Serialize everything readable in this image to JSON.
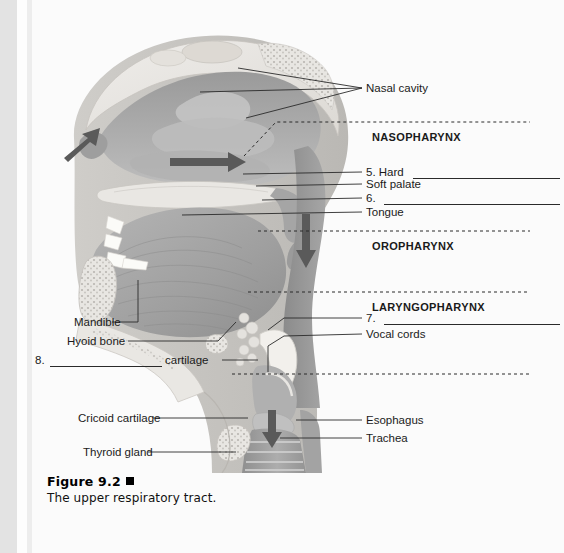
{
  "figure": {
    "number_label": "Figure 9.2",
    "marker": "square-bullet",
    "caption": "The upper respiratory tract."
  },
  "regions": [
    {
      "id": "nasopharynx",
      "label": "NASOPHARYNX"
    },
    {
      "id": "oropharynx",
      "label": "OROPHARYNX"
    },
    {
      "id": "laryngopharynx",
      "label": "LARYNGOPHARYNX"
    }
  ],
  "labels_right": [
    {
      "id": "nasal-cavity",
      "text": "Nasal cavity",
      "blank": false
    },
    {
      "id": "item-5",
      "text": "5. Hard",
      "blank": true
    },
    {
      "id": "soft-palate",
      "text": "Soft palate",
      "blank": false
    },
    {
      "id": "item-6",
      "text": "6.",
      "blank": true
    },
    {
      "id": "tongue",
      "text": "Tongue",
      "blank": false
    },
    {
      "id": "item-7",
      "text": "7.",
      "blank": true
    },
    {
      "id": "vocal-cords",
      "text": "Vocal cords",
      "blank": false
    },
    {
      "id": "esophagus",
      "text": "Esophagus",
      "blank": false
    },
    {
      "id": "trachea",
      "text": "Trachea",
      "blank": false
    }
  ],
  "labels_left": [
    {
      "id": "mandible",
      "text": "Mandible",
      "blank": false
    },
    {
      "id": "hyoid-bone",
      "text": "Hyoid bone",
      "blank": false
    },
    {
      "id": "item-8-number",
      "text": "8.",
      "blank": true
    },
    {
      "id": "item-8-suffix",
      "text": "cartilage",
      "blank": false
    },
    {
      "id": "cricoid-cartilage",
      "text": "Cricoid cartilage",
      "blank": false
    },
    {
      "id": "thyroid-gland",
      "text": "Thyroid gland",
      "blank": false
    }
  ],
  "airflow_arrows": [
    {
      "id": "inhaled-air-nostril",
      "direction": "up-left"
    },
    {
      "id": "nasal-airflow",
      "direction": "right"
    },
    {
      "id": "pharynx-airflow",
      "direction": "down"
    },
    {
      "id": "trachea-airflow",
      "direction": "down"
    }
  ],
  "colors": {
    "ink": "#1a1a1a",
    "leader": "#2a2a2a",
    "tissue_dark": "#8d8d8d",
    "tissue_mid": "#a9a9a9",
    "tissue_light": "#c9c9c9",
    "bone": "#e6e4e0",
    "page": "#fbfbfb"
  }
}
